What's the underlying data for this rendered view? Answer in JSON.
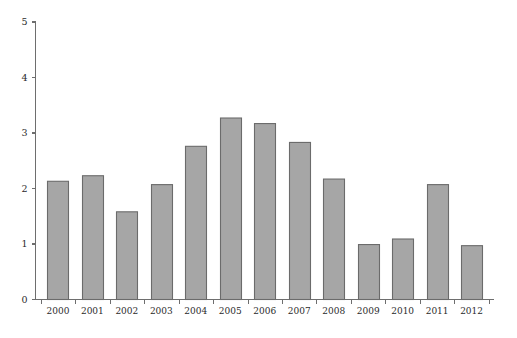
{
  "chart_data": {
    "type": "bar",
    "title": "",
    "subtitle": "",
    "xlabel": "",
    "ylabel": "",
    "categories": [
      "2000",
      "2001",
      "2002",
      "2003",
      "2004",
      "2005",
      "2006",
      "2007",
      "2008",
      "2009",
      "2010",
      "2011",
      "2012"
    ],
    "values": [
      2.13,
      2.23,
      1.58,
      2.07,
      2.76,
      3.27,
      3.17,
      2.83,
      2.17,
      0.99,
      1.09,
      2.07,
      0.97
    ],
    "series": [
      {
        "name": "",
        "values": [
          2.13,
          2.23,
          1.58,
          2.07,
          2.76,
          3.27,
          3.17,
          2.83,
          2.17,
          0.99,
          1.09,
          2.07,
          0.97
        ]
      }
    ],
    "ylim": [
      0,
      5
    ],
    "yticks": [
      0,
      1,
      2,
      3,
      4,
      5
    ],
    "ytick_labels": [
      "0",
      "1",
      "2",
      "3",
      "4",
      "5"
    ],
    "xtick_labels": [
      "2000",
      "2001",
      "2002",
      "2003",
      "2004",
      "2005",
      "2006",
      "2007",
      "2008",
      "2009",
      "2010",
      "2011",
      "2012"
    ],
    "grid": false,
    "legend": null,
    "legend_position": "none",
    "annotations": [],
    "colors": {
      "bar_fill": "#a6a6a6",
      "bar_stroke": "#6b6b6b",
      "axis": "#6e6e6e",
      "text": "#2b2b2b",
      "background": "#ffffff"
    }
  }
}
